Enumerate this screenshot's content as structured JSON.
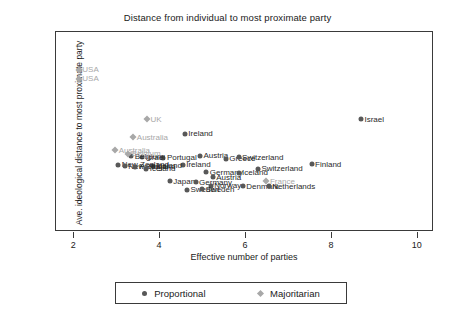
{
  "chart_data": {
    "type": "scatter",
    "title": "Distance from individual to most proximate party",
    "xlabel": "Effective number of parties",
    "ylabel": "Ave. ideological distance to most proximate party",
    "xlim": [
      1.6,
      10.4
    ],
    "ylim": [
      -0.04,
      1.6
    ],
    "xticks": [
      "2",
      "4",
      "6",
      "8",
      "10"
    ],
    "xtick_values": [
      2,
      4,
      6,
      8,
      10
    ],
    "yticks": [
      "0",
      ".5",
      "1",
      "1.5"
    ],
    "ytick_values": [
      0,
      0.5,
      1,
      1.5
    ],
    "grid": false,
    "legend_position": "bottom",
    "series": [
      {
        "name": "Proportional",
        "marker": "circle",
        "color": "#585858",
        "points": [
          {
            "label": "Israel",
            "x": 8.7,
            "y": 0.885
          },
          {
            "label": "Ireland",
            "x": 4.6,
            "y": 0.765
          },
          {
            "label": "Austria",
            "x": 4.95,
            "y": 0.585
          },
          {
            "label": "Greece",
            "x": 5.55,
            "y": 0.56
          },
          {
            "label": "Switzerland",
            "x": 5.85,
            "y": 0.575
          },
          {
            "label": "Portugal",
            "x": 4.1,
            "y": 0.57
          },
          {
            "label": "Israel",
            "x": 3.6,
            "y": 0.575
          },
          {
            "label": "Belgium",
            "x": 3.35,
            "y": 0.58
          },
          {
            "label": "Finland",
            "x": 7.55,
            "y": 0.515
          },
          {
            "label": "Switzerland",
            "x": 6.3,
            "y": 0.48
          },
          {
            "label": "Ireland",
            "x": 4.55,
            "y": 0.51
          },
          {
            "label": "Iceland",
            "x": 3.85,
            "y": 0.505
          },
          {
            "label": "New Zealand",
            "x": 3.05,
            "y": 0.51
          },
          {
            "label": "New Zealand",
            "x": 3.2,
            "y": 0.5
          },
          {
            "label": "Portugal",
            "x": 3.45,
            "y": 0.495
          },
          {
            "label": "Iceland",
            "x": 3.7,
            "y": 0.478
          },
          {
            "label": "Germany",
            "x": 5.1,
            "y": 0.45
          },
          {
            "label": "Iceland",
            "x": 5.85,
            "y": 0.445
          },
          {
            "label": "Austria",
            "x": 5.25,
            "y": 0.41
          },
          {
            "label": "Japan",
            "x": 4.25,
            "y": 0.375
          },
          {
            "label": "Germany",
            "x": 4.85,
            "y": 0.37
          },
          {
            "label": "Norway",
            "x": 5.2,
            "y": 0.34
          },
          {
            "label": "Denmark",
            "x": 5.95,
            "y": 0.335
          },
          {
            "label": "Netherlands",
            "x": 6.55,
            "y": 0.335
          },
          {
            "label": "Sweden",
            "x": 4.65,
            "y": 0.305
          },
          {
            "label": "Sweden",
            "x": 5.0,
            "y": 0.31
          }
        ]
      },
      {
        "name": "Majoritarian",
        "marker": "diamond",
        "color": "#a8a8a8",
        "points": [
          {
            "label": "USA",
            "x": 2.13,
            "y": 1.29
          },
          {
            "label": "USA",
            "x": 2.13,
            "y": 1.215
          },
          {
            "label": "UK",
            "x": 3.72,
            "y": 0.885
          },
          {
            "label": "Australia",
            "x": 3.4,
            "y": 0.735
          },
          {
            "label": "Australia",
            "x": 2.98,
            "y": 0.63
          },
          {
            "label": "Belgium",
            "x": 3.28,
            "y": 0.6
          },
          {
            "label": "France",
            "x": 6.5,
            "y": 0.375
          }
        ]
      }
    ]
  },
  "legend": {
    "items": [
      {
        "label": "Proportional",
        "marker": "circle"
      },
      {
        "label": "Majoritarian",
        "marker": "diamond"
      }
    ]
  }
}
